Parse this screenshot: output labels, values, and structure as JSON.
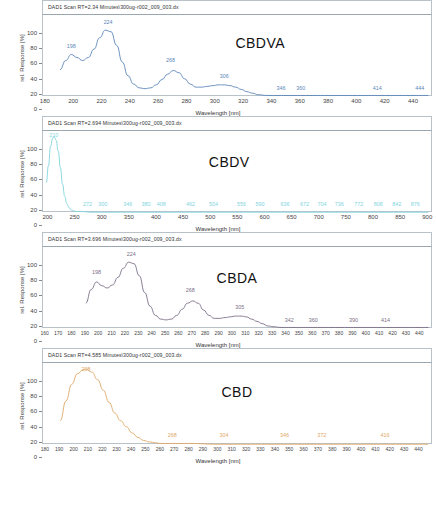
{
  "axis": {
    "ylabel": "rel. Response [%]",
    "xlabel": "Wavelength [nm]",
    "yticks": [
      0,
      20,
      40,
      60,
      80,
      100
    ]
  },
  "chart_data": [
    {
      "type": "line",
      "title": "DAD1 Scan RT=2.34 Minutes\\300ug-r002_009_003.dx",
      "compound": "CBDVA",
      "color": "#5b86b8",
      "xlabel": "Wavelength [nm]",
      "ylabel": "rel. Response [%]",
      "xlim": [
        178,
        452
      ],
      "ylim": [
        0,
        108
      ],
      "xticks": [
        180,
        200,
        220,
        240,
        260,
        280,
        300,
        320,
        340,
        360,
        380,
        400,
        420,
        440
      ],
      "grid": false,
      "annotations": [
        {
          "x": 198,
          "y": 62,
          "text": "198"
        },
        {
          "x": 224,
          "y": 93,
          "text": "224"
        },
        {
          "x": 268,
          "y": 44,
          "text": "268"
        },
        {
          "x": 306,
          "y": 22,
          "text": "306"
        },
        {
          "x": 346,
          "y": 6,
          "text": "346"
        },
        {
          "x": 360,
          "y": 6,
          "text": "360"
        },
        {
          "x": 414,
          "y": 6,
          "text": "414"
        },
        {
          "x": 444,
          "y": 6,
          "text": "444"
        }
      ],
      "x": [
        190,
        194,
        198,
        202,
        206,
        210,
        214,
        218,
        222,
        226,
        230,
        234,
        238,
        242,
        246,
        250,
        254,
        258,
        262,
        266,
        270,
        274,
        278,
        282,
        286,
        290,
        294,
        298,
        302,
        306,
        310,
        314,
        318,
        322,
        326,
        330,
        336,
        344,
        352,
        360,
        380,
        400,
        420,
        440,
        450
      ],
      "y": [
        36,
        48,
        56,
        52,
        48,
        52,
        63,
        78,
        88,
        86,
        68,
        46,
        28,
        17,
        12,
        11,
        12,
        16,
        23,
        30,
        35,
        32,
        24,
        17,
        13,
        13,
        14,
        15,
        16,
        16,
        15,
        13,
        10,
        7,
        5,
        3,
        2,
        2,
        2,
        2,
        2,
        2,
        2,
        2,
        2
      ]
    },
    {
      "type": "line",
      "title": "DAD1 Scan RT=2.694 Minutes\\300ug-r002_009_003.dx",
      "compound": "CBDV",
      "color": "#7fd4dd",
      "xlabel": "Wavelength [nm]",
      "ylabel": "rel. Response [%]",
      "xlim": [
        190,
        905
      ],
      "ylim": [
        0,
        108
      ],
      "xticks": [
        200,
        250,
        300,
        350,
        400,
        450,
        500,
        550,
        600,
        650,
        700,
        750,
        800,
        850,
        900
      ],
      "grid": false,
      "annotations": [
        {
          "x": 210,
          "y": 97,
          "text": "210"
        },
        {
          "x": 272,
          "y": 6,
          "text": "272"
        },
        {
          "x": 300,
          "y": 6,
          "text": "300"
        },
        {
          "x": 346,
          "y": 6,
          "text": "346"
        },
        {
          "x": 380,
          "y": 6,
          "text": "380"
        },
        {
          "x": 408,
          "y": 6,
          "text": "408"
        },
        {
          "x": 462,
          "y": 6,
          "text": "462"
        },
        {
          "x": 504,
          "y": 6,
          "text": "504"
        },
        {
          "x": 556,
          "y": 6,
          "text": "556"
        },
        {
          "x": 590,
          "y": 6,
          "text": "590"
        },
        {
          "x": 636,
          "y": 6,
          "text": "636"
        },
        {
          "x": 672,
          "y": 6,
          "text": "672"
        },
        {
          "x": 704,
          "y": 6,
          "text": "704"
        },
        {
          "x": 736,
          "y": 6,
          "text": "736"
        },
        {
          "x": 772,
          "y": 6,
          "text": "772"
        },
        {
          "x": 808,
          "y": 6,
          "text": "808"
        },
        {
          "x": 842,
          "y": 6,
          "text": "842"
        },
        {
          "x": 876,
          "y": 6,
          "text": "876"
        }
      ],
      "x": [
        196,
        200,
        204,
        208,
        211,
        214,
        218,
        222,
        226,
        230,
        234,
        238,
        242,
        246,
        250,
        260,
        280,
        320,
        400,
        500,
        600,
        700,
        800,
        900
      ],
      "y": [
        40,
        62,
        88,
        99,
        100,
        96,
        82,
        60,
        38,
        22,
        12,
        7,
        4,
        3,
        2,
        2,
        1,
        1,
        1,
        1,
        1,
        1,
        1,
        1
      ]
    },
    {
      "type": "line",
      "title": "DAD1 Scan RT=3.696 Minutes\\300ug-r002_009_003.dx",
      "compound": "CBDA",
      "color": "#7a6e86",
      "xlabel": "Wavelength [nm]",
      "ylabel": "rel. Response [%]",
      "xlim": [
        158,
        448
      ],
      "ylim": [
        0,
        108
      ],
      "xticks": [
        160,
        170,
        180,
        190,
        200,
        210,
        220,
        230,
        240,
        250,
        260,
        270,
        280,
        290,
        300,
        310,
        320,
        330,
        340,
        350,
        360,
        370,
        380,
        390,
        400,
        410,
        420,
        430,
        440
      ],
      "grid": false,
      "annotations": [
        {
          "x": 198,
          "y": 70,
          "text": "198"
        },
        {
          "x": 224,
          "y": 93,
          "text": "224"
        },
        {
          "x": 268,
          "y": 46,
          "text": "268"
        },
        {
          "x": 305,
          "y": 24,
          "text": "305"
        },
        {
          "x": 342,
          "y": 7,
          "text": "342"
        },
        {
          "x": 360,
          "y": 7,
          "text": "360"
        },
        {
          "x": 390,
          "y": 7,
          "text": "390"
        },
        {
          "x": 414,
          "y": 7,
          "text": "414"
        }
      ],
      "x": [
        190,
        194,
        198,
        202,
        206,
        210,
        214,
        218,
        222,
        226,
        230,
        234,
        238,
        242,
        246,
        250,
        254,
        258,
        262,
        266,
        270,
        274,
        278,
        282,
        286,
        290,
        294,
        298,
        302,
        306,
        310,
        314,
        318,
        322,
        326,
        330,
        336,
        344,
        352,
        360,
        380,
        400,
        420,
        440,
        446
      ],
      "y": [
        34,
        52,
        62,
        57,
        54,
        58,
        68,
        80,
        88,
        86,
        70,
        48,
        30,
        18,
        13,
        12,
        13,
        18,
        26,
        34,
        37,
        34,
        25,
        18,
        14,
        14,
        15,
        16,
        17,
        17,
        16,
        13,
        10,
        7,
        4,
        3,
        2,
        2,
        2,
        2,
        2,
        2,
        2,
        2,
        2
      ]
    },
    {
      "type": "line",
      "title": "DAD1 Scan RT=4.585 Minutes\\300ug-r002_009_003.dx",
      "compound": "CBD",
      "color": "#e0a868",
      "xlabel": "Wavelength [nm]",
      "ylabel": "rel. Response [%]",
      "xlim": [
        178,
        448
      ],
      "ylim": [
        0,
        108
      ],
      "xticks": [
        180,
        190,
        200,
        210,
        220,
        230,
        240,
        250,
        260,
        270,
        280,
        290,
        300,
        310,
        320,
        330,
        340,
        350,
        360,
        370,
        380,
        390,
        400,
        410,
        420,
        430,
        440
      ],
      "grid": false,
      "annotations": [
        {
          "x": 208,
          "y": 95,
          "text": "208"
        },
        {
          "x": 268,
          "y": 8,
          "text": "268"
        },
        {
          "x": 304,
          "y": 8,
          "text": "304"
        },
        {
          "x": 346,
          "y": 8,
          "text": "346"
        },
        {
          "x": 372,
          "y": 8,
          "text": "372"
        },
        {
          "x": 416,
          "y": 8,
          "text": "416"
        }
      ],
      "x": [
        190,
        194,
        198,
        202,
        206,
        208,
        212,
        216,
        220,
        224,
        228,
        232,
        236,
        240,
        244,
        248,
        252,
        256,
        260,
        270,
        280,
        300,
        320,
        340,
        360,
        380,
        400,
        420,
        440,
        446
      ],
      "y": [
        32,
        58,
        80,
        94,
        99,
        100,
        96,
        86,
        72,
        56,
        42,
        32,
        24,
        16,
        10,
        6,
        4,
        3,
        2,
        2,
        2,
        1,
        1,
        1,
        1,
        1,
        1,
        1,
        1,
        1
      ]
    }
  ]
}
